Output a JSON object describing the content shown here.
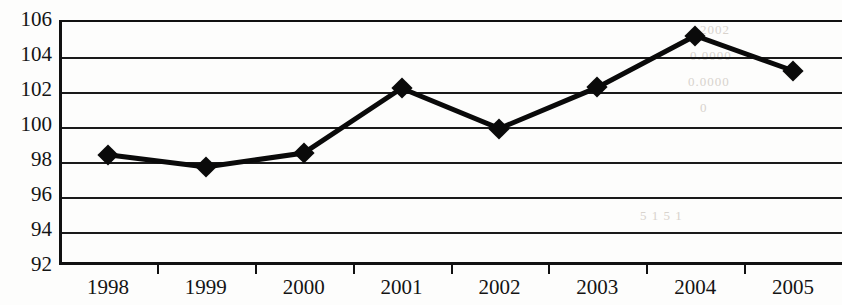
{
  "chart_data": {
    "type": "line",
    "title": "",
    "subtitle": "",
    "xlabel": "",
    "ylabel": "",
    "categories": [
      "1998",
      "1999",
      "2000",
      "2001",
      "2002",
      "2003",
      "2004",
      "2005"
    ],
    "values": [
      98.3,
      97.6,
      98.4,
      102.1,
      99.8,
      102.15,
      105.1,
      103.1
    ],
    "series": [
      {
        "name": "Index",
        "values": [
          98.3,
          97.6,
          98.4,
          102.1,
          99.8,
          102.15,
          105.1,
          103.1
        ]
      }
    ],
    "ylim": [
      92,
      106
    ],
    "yticks": [
      92,
      94,
      96,
      98,
      100,
      102,
      104,
      106
    ],
    "ytick_labels": [
      "92",
      "94",
      "96",
      "98",
      "100",
      "102",
      "104",
      "106"
    ],
    "grid": "horizontal",
    "legend": "none",
    "marker": "diamond",
    "marker_color": "#0a0a0a",
    "line_color": "#0a0a0a",
    "axis_color": "#111111",
    "background_color": "#fdfdfc",
    "annotations": []
  },
  "artifacts": {
    "ghost_text": [
      "2002",
      "0.0000",
      "0.0000",
      "0",
      "5 1 5 1",
      "scan bleed"
    ]
  }
}
